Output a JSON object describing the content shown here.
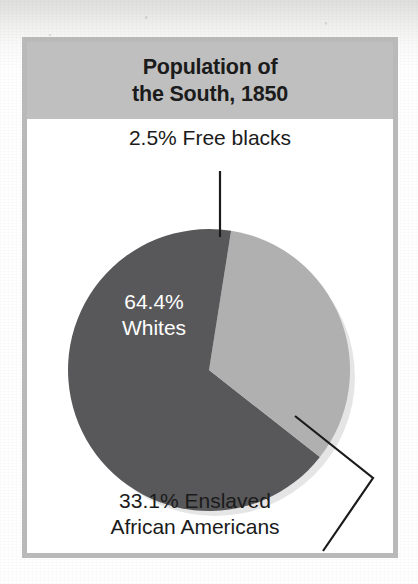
{
  "figure": {
    "title_line_1": "Population of",
    "title_line_2": "the South, 1850",
    "title_band_color": "#bfbfbf",
    "frame_color": "#b9b9b9",
    "background_color": "#ffffff"
  },
  "chart_data": {
    "type": "pie",
    "title": "Population of the South, 1850",
    "subtitle": "",
    "xlabel": "",
    "ylabel": "",
    "legend_position": "none",
    "grid": false,
    "units": "percent",
    "categories": [
      "Whites",
      "Enslaved African Americans",
      "Free blacks"
    ],
    "values": [
      64.4,
      33.1,
      2.5
    ],
    "colors": [
      "#58585a",
      "#b0b0b0",
      "#58585a"
    ],
    "slices": [
      {
        "name": "Free blacks",
        "value": 2.5,
        "value_label": "2.5%",
        "label": "2.5% Free blacks",
        "color": "#58585a",
        "label_placement": "outside-top",
        "leader_line": true
      },
      {
        "name": "Enslaved African Americans",
        "value": 33.1,
        "value_label": "33.1%",
        "label_line_1": "33.1% Enslaved",
        "label_line_2": "African Americans",
        "label": "33.1% Enslaved African Americans",
        "color": "#b0b0b0",
        "label_placement": "outside-bottom",
        "leader_line": true
      },
      {
        "name": "Whites",
        "value": 64.4,
        "value_label": "64.4%",
        "label_line_1": "64.4%",
        "label_line_2": "Whites",
        "label": "64.4% Whites",
        "color": "#58585a",
        "label_placement": "inside",
        "label_text_color": "#ffffff",
        "leader_line": false
      }
    ]
  }
}
